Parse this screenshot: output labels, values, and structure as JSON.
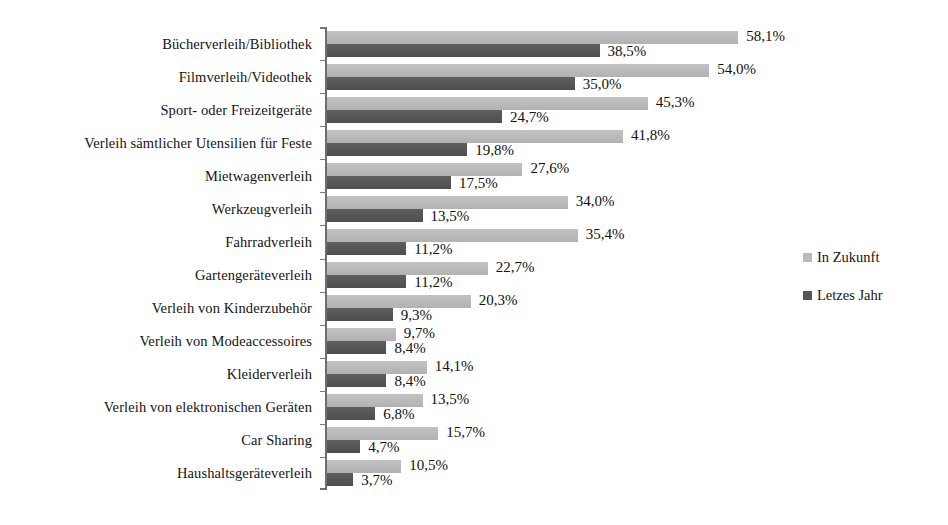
{
  "chart_data": {
    "type": "bar",
    "orientation": "horizontal",
    "title": "",
    "xlabel": "",
    "ylabel": "",
    "xlim": [
      0,
      60
    ],
    "grid": false,
    "legend_position": "right",
    "value_suffix": "%",
    "decimal_separator": ",",
    "categories": [
      "Bücherverleih/Bibliothek",
      "Filmverleih/Videothek",
      "Sport- oder Freizeitgeräte",
      "Verleih sämtlicher Utensilien für Feste",
      "Mietwagenverleih",
      "Werkzeugverleih",
      "Fahrradverleih",
      "Gartengeräteverleih",
      "Verleih von Kinderzubehör",
      "Verleih von Modeaccessoires",
      "Kleiderverleih",
      "Verleih von elektronischen Geräten",
      "Car Sharing",
      "Haushaltsgeräteverleih"
    ],
    "series": [
      {
        "name": "In Zukunft",
        "color": "#b9b9b9",
        "values": [
          58.1,
          54.0,
          45.3,
          41.8,
          27.6,
          34.0,
          35.4,
          22.7,
          20.3,
          9.7,
          14.1,
          13.5,
          15.7,
          10.5
        ],
        "labels": [
          "58,1%",
          "54,0%",
          "45,3%",
          "41,8%",
          "27,6%",
          "34,0%",
          "35,4%",
          "22,7%",
          "20,3%",
          "9,7%",
          "14,1%",
          "13,5%",
          "15,7%",
          "10,5%"
        ]
      },
      {
        "name": "Letzes Jahr",
        "color": "#565656",
        "values": [
          38.5,
          35.0,
          24.7,
          19.8,
          17.5,
          13.5,
          11.2,
          11.2,
          9.3,
          8.4,
          8.4,
          6.8,
          4.7,
          3.7
        ],
        "labels": [
          "38,5%",
          "35,0%",
          "24,7%",
          "19,8%",
          "17,5%",
          "13,5%",
          "11,2%",
          "11,2%",
          "9,3%",
          "8,4%",
          "8,4%",
          "6,8%",
          "4,7%",
          "3,7%"
        ]
      }
    ]
  },
  "legend": {
    "items": [
      {
        "label": "In Zukunft",
        "swatch": "future"
      },
      {
        "label": "Letzes Jahr",
        "swatch": "lastyear"
      }
    ]
  }
}
